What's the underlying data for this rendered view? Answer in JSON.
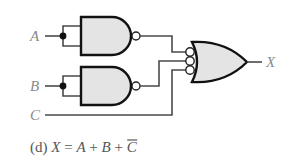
{
  "diagram": {
    "type": "logic-circuit",
    "inputs": [
      {
        "label": "A"
      },
      {
        "label": "B"
      },
      {
        "label": "C"
      }
    ],
    "output": {
      "label": "X"
    },
    "gates": [
      {
        "id": "nand-a",
        "type": "NAND",
        "inputs": [
          "A",
          "A"
        ],
        "note": "inputs tied together (inverter)"
      },
      {
        "id": "nand-b",
        "type": "NAND",
        "inputs": [
          "B",
          "B"
        ],
        "note": "inputs tied together (inverter)"
      },
      {
        "id": "or-out",
        "type": "OR with inverted inputs",
        "inputs": [
          "nand-a",
          "nand-b",
          "C"
        ],
        "output": "X"
      }
    ],
    "caption": {
      "prefix": "(d) ",
      "lhs": "X",
      "eq": " = ",
      "t1": "A",
      "plus1": " + ",
      "t2": "B",
      "plus2": " + ",
      "t3": "C",
      "t3_overbar": true
    }
  },
  "colors": {
    "gate_fill": "#e4e4e4",
    "gate_stroke": "#111111",
    "label": "#8a8a8a"
  }
}
